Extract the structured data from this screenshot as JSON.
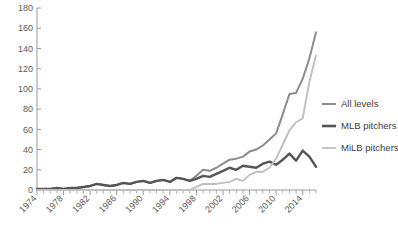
{
  "chart_data": {
    "type": "line",
    "title": "",
    "xlabel": "",
    "ylabel": "",
    "xlim": [
      1974,
      2016
    ],
    "ylim": [
      0,
      180
    ],
    "ytick_step": 20,
    "yticks": [
      0,
      20,
      40,
      60,
      80,
      100,
      120,
      140,
      160,
      180
    ],
    "xticks": [
      1974,
      1978,
      1982,
      1986,
      1990,
      1994,
      1998,
      2002,
      2006,
      2010,
      2014
    ],
    "x_minor_tick_interval": 1,
    "grid": false,
    "legend_position": "right",
    "x": [
      1974,
      1975,
      1976,
      1977,
      1978,
      1979,
      1980,
      1981,
      1982,
      1983,
      1984,
      1985,
      1986,
      1987,
      1988,
      1989,
      1990,
      1991,
      1992,
      1993,
      1994,
      1995,
      1996,
      1997,
      1998,
      1999,
      2000,
      2001,
      2002,
      2003,
      2004,
      2005,
      2006,
      2007,
      2008,
      2009,
      2010,
      2011,
      2012,
      2013,
      2014,
      2015,
      2016
    ],
    "series": [
      {
        "name": "All levels",
        "color": "#8c8c8c",
        "values": [
          1,
          1,
          1,
          2,
          1,
          2,
          2,
          3,
          4,
          6,
          5,
          4,
          5,
          7,
          6,
          8,
          9,
          7,
          9,
          10,
          8,
          12,
          11,
          9,
          14,
          20,
          19,
          22,
          26,
          30,
          31,
          33,
          38,
          40,
          44,
          50,
          56,
          75,
          95,
          96,
          110,
          130,
          156
        ]
      },
      {
        "name": "MLB pitchers",
        "color": "#555555",
        "values": [
          1,
          1,
          1,
          2,
          1,
          2,
          2,
          3,
          4,
          6,
          5,
          4,
          5,
          7,
          6,
          8,
          9,
          7,
          9,
          10,
          8,
          12,
          11,
          9,
          11,
          14,
          13,
          16,
          19,
          22,
          20,
          24,
          23,
          22,
          26,
          28,
          25,
          30,
          36,
          29,
          39,
          33,
          23
        ]
      },
      {
        "name": "MiLB pitchers",
        "color": "#bfbfbf",
        "values": [
          0,
          0,
          0,
          0,
          0,
          0,
          0,
          0,
          0,
          0,
          0,
          0,
          0,
          0,
          0,
          0,
          0,
          0,
          0,
          0,
          0,
          0,
          0,
          0,
          3,
          6,
          6,
          6,
          7,
          8,
          11,
          9,
          15,
          18,
          18,
          22,
          31,
          45,
          59,
          67,
          71,
          107,
          133
        ]
      }
    ]
  },
  "legend": {
    "items": [
      {
        "label": "All levels",
        "color": "#8c8c8c",
        "thickness": 2.0
      },
      {
        "label": "MLB pitchers",
        "color": "#555555",
        "thickness": 2.6
      },
      {
        "label": "MiLB pitchers",
        "color": "#bfbfbf",
        "thickness": 1.8
      }
    ]
  },
  "axes": {
    "y_labels": [
      "180",
      "160",
      "140",
      "120",
      "100",
      "80",
      "60",
      "40",
      "20",
      "0"
    ],
    "x_labels": [
      "1974",
      "1978",
      "1982",
      "1986",
      "1990",
      "1994",
      "1998",
      "2002",
      "2006",
      "2010",
      "2014"
    ]
  }
}
